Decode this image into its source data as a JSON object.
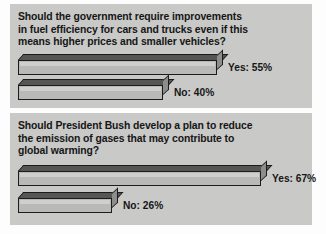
{
  "chart_data": [
    {
      "type": "bar",
      "title": "Should the government require improvements in fuel efficiency for cars and trucks even if this means higher prices and smaller vehicles?",
      "title_lines": [
        "Should the government require improvements",
        "in fuel efficiency for cars and trucks even if this",
        "means higher prices and smaller vehicles?"
      ],
      "orientation": "horizontal",
      "categories": [
        "Yes",
        "No"
      ],
      "values": [
        55,
        40
      ],
      "value_unit": "%",
      "labels": [
        "Yes: 55%",
        "No: 40%"
      ],
      "xlabel": "",
      "ylabel": "",
      "xlim": [
        0,
        100
      ],
      "grid": false,
      "legend": false,
      "style": "3d-isometric"
    },
    {
      "type": "bar",
      "title": "Should President Bush develop a plan to reduce the emission of gases that may contribute to global warming?",
      "title_lines": [
        "Should President Bush develop a plan to reduce",
        "the emission of gases that may contribute to",
        "global warming?"
      ],
      "orientation": "horizontal",
      "categories": [
        "Yes",
        "No"
      ],
      "values": [
        67,
        26
      ],
      "value_unit": "%",
      "labels": [
        "Yes: 67%",
        "No: 26%"
      ],
      "xlabel": "",
      "ylabel": "",
      "xlim": [
        0,
        100
      ],
      "grid": false,
      "legend": false,
      "style": "3d-isometric"
    }
  ],
  "colors": {
    "panel_background": "#c9c9c7",
    "page_background": "#fdfdfd",
    "bar_front": "#b9b9b7",
    "bar_top": "#565654",
    "bar_side": "#8d8d8b",
    "bar_outline": "#1c1c1c",
    "text": "#161616"
  }
}
